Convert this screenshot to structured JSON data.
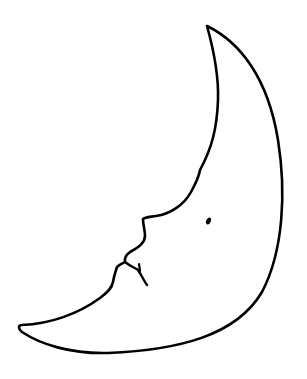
{
  "drawing": {
    "subject": "crescent moon with face",
    "colors": {
      "background": "#ffffff",
      "stroke": "#000000",
      "fill": "#ffffff"
    },
    "stroke_width": 2.6,
    "features": [
      "crescent-outline",
      "nose",
      "lips",
      "mouth-line",
      "eye"
    ]
  }
}
